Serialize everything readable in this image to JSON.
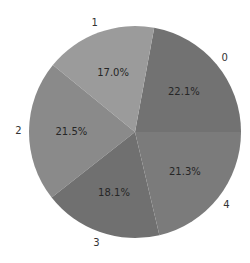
{
  "chart_data": {
    "type": "pie",
    "title": "",
    "categories": [
      "0",
      "1",
      "2",
      "3",
      "4"
    ],
    "values": [
      22.1,
      17.0,
      21.5,
      18.1,
      21.3
    ],
    "labels": [
      "22.1%",
      "17.0%",
      "21.5%",
      "18.1%",
      "21.3%"
    ],
    "colors": [
      "#727272",
      "#9b9b9b",
      "#8a8a8a",
      "#707070",
      "#7b7b7b"
    ],
    "start_angle_deg": 0,
    "direction": "counterclockwise",
    "legend": false
  }
}
